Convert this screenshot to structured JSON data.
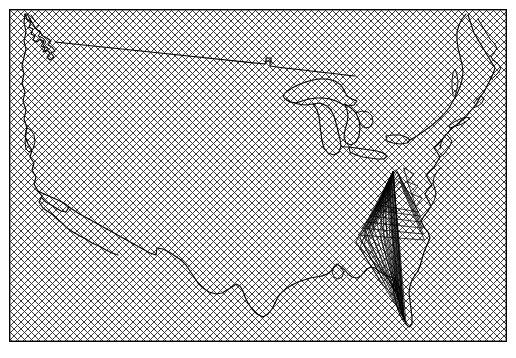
{
  "figure": {
    "type": "map",
    "width": 516,
    "height": 358,
    "background_color": "#ffffff"
  },
  "frame": {
    "name": "map-bounding-frame",
    "x": 9,
    "y": 9,
    "width": 498,
    "height": 333,
    "stroke_color": "#000000",
    "stroke_width": 1.4,
    "fill": "none"
  },
  "hatch": {
    "name": "diagonal-crosshatch-fill",
    "pattern": "crosshatch",
    "angle_degrees": 45,
    "spacing_px": 7,
    "stroke_color": "#3a3a3a",
    "stroke_width": 1.0,
    "background_color": "#ffffff",
    "description": "45-degree diagonal crosshatch covering the entire map frame interior"
  },
  "geography": {
    "name": "united-states-boundary",
    "stroke_color": "#000000",
    "stroke_width": 1.15,
    "features": [
      {
        "name": "national-outline",
        "label": "Contiguous US national boundary"
      },
      {
        "name": "northern-border",
        "label": "US-Canada 49th parallel border"
      },
      {
        "name": "southern-border",
        "label": "US-Mexico border"
      },
      {
        "name": "pacific-coast",
        "label": "Pacific coastline"
      },
      {
        "name": "atlantic-coast",
        "label": "Atlantic coastline"
      },
      {
        "name": "gulf-coast",
        "label": "Gulf of Mexico coastline"
      },
      {
        "name": "great-lakes",
        "label": "Great Lakes shorelines"
      },
      {
        "name": "florida-peninsula",
        "label": "Florida peninsula"
      },
      {
        "name": "puget-sound",
        "label": "Puget Sound"
      },
      {
        "name": "san-francisco-bay",
        "label": "San Francisco Bay"
      },
      {
        "name": "chesapeake-bay",
        "label": "Chesapeake Bay"
      },
      {
        "name": "long-island",
        "label": "Long Island"
      }
    ]
  },
  "mesh": {
    "name": "triangulated-mesh-overlay",
    "label": "Triangle fan mesh over southeastern United States",
    "stroke_color": "#000000",
    "stroke_width": 0.75,
    "region": "southeast",
    "approx_bounds": {
      "x": 355,
      "y": 168,
      "width": 80,
      "height": 160
    },
    "triangle_count": 34
  }
}
